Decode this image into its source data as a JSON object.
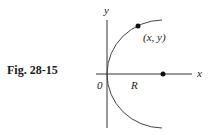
{
  "figure": {
    "caption": "Fig. 28-15",
    "axes": {
      "x_label": "x",
      "y_label": "y",
      "origin_label": "0"
    },
    "labels": {
      "point": "(x, y)",
      "radius": "R"
    },
    "colors": {
      "line": "#333333",
      "dot": "#111111",
      "text": "#222222"
    }
  }
}
